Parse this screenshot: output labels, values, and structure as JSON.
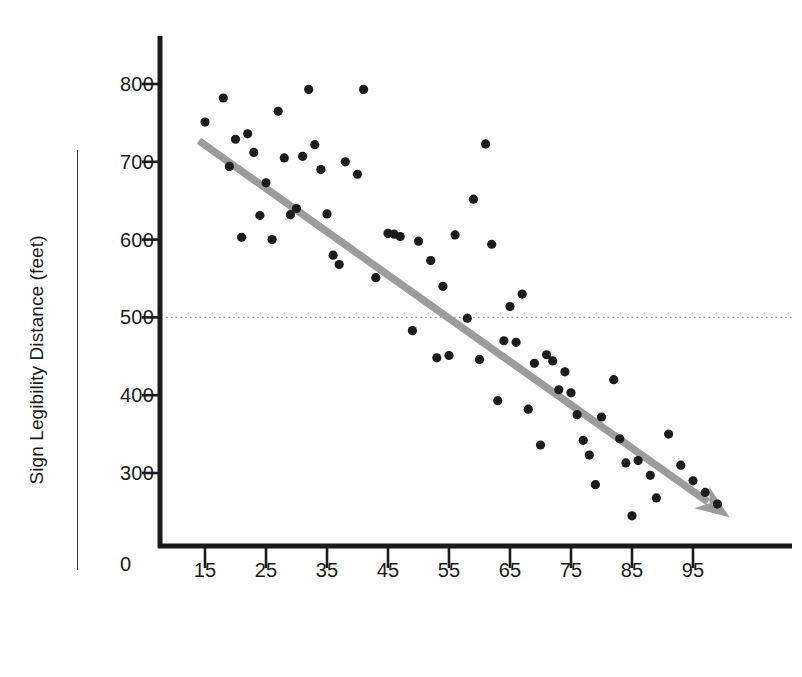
{
  "chart_data": {
    "type": "scatter",
    "title": "",
    "xlabel": "Driver Age (years)",
    "ylabel": "Sign Legibility Distance (feet)",
    "xlim": [
      10,
      103
    ],
    "ylim": [
      0,
      830
    ],
    "grid": false,
    "legend": "none",
    "x_ticks": [
      15,
      25,
      35,
      45,
      55,
      65,
      75,
      85,
      95
    ],
    "y_ticks": [
      300,
      400,
      500,
      600,
      700,
      800
    ],
    "y_origin_label": "0",
    "reference_line": {
      "axis": "y",
      "value": 500,
      "style": "dotted",
      "color": "#9a9a9a"
    },
    "trend_line": {
      "label": "regression trend",
      "style": "solid-arrow",
      "color": "#9c9c9c",
      "x_start": 14,
      "y_start": 727,
      "x_end": 101,
      "y_end": 243,
      "slope": -5.56,
      "intercept": 805
    },
    "point_color": "#1c1c1c",
    "x": [
      18,
      20,
      22,
      23,
      25,
      27,
      28,
      29,
      32,
      33,
      34,
      37,
      41,
      46,
      49,
      53,
      55,
      60,
      62,
      63,
      65,
      68,
      70,
      72,
      74,
      75,
      77,
      79,
      82,
      85,
      15,
      19,
      21,
      24,
      26,
      30,
      31,
      35,
      36,
      38,
      40,
      43,
      45,
      47,
      50,
      52,
      54,
      56,
      58,
      59,
      61,
      64,
      66,
      67,
      69,
      71,
      73,
      76,
      78,
      80,
      83,
      84,
      86,
      88,
      89,
      91,
      93,
      95,
      97,
      99
    ],
    "y": [
      782,
      729,
      736,
      712,
      673,
      765,
      705,
      632,
      793,
      722,
      690,
      568,
      793,
      607,
      483,
      448,
      451,
      446,
      594,
      393,
      514,
      382,
      336,
      444,
      430,
      403,
      342,
      285,
      420,
      245,
      751,
      694,
      603,
      631,
      600,
      640,
      707,
      633,
      580,
      700,
      684,
      551,
      608,
      604,
      598,
      573,
      540,
      606,
      499,
      652,
      723,
      470,
      468,
      530,
      441,
      452,
      407,
      375,
      323,
      372,
      344,
      313,
      316,
      297,
      268,
      350,
      310,
      290,
      275,
      260
    ]
  },
  "figure": {
    "y_axis_title": "Sign Legibility Distance (feet)",
    "x_axis_title": "Driver Age (years)",
    "zero_label": "0",
    "y_tick_labels": [
      "800",
      "700",
      "600",
      "500",
      "400",
      "300"
    ],
    "x_tick_labels": [
      "15",
      "25",
      "35",
      "45",
      "55",
      "65",
      "75",
      "85",
      "95"
    ]
  }
}
